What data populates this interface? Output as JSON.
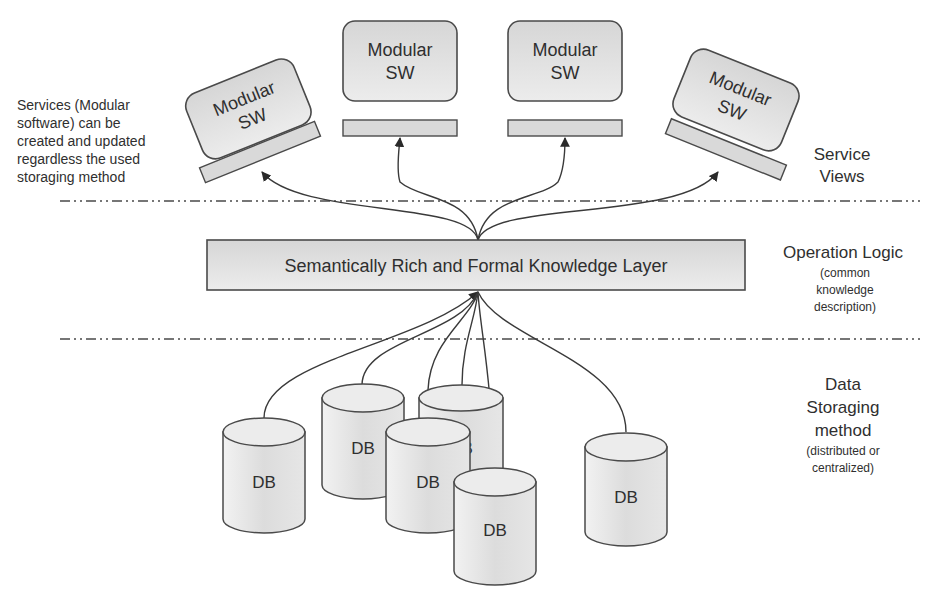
{
  "diagram": {
    "layers": {
      "service_views": {
        "label_line1": "Service",
        "label_line2": "Views"
      },
      "operation_logic": {
        "label": "Operation Logic",
        "sub_line1": "(common",
        "sub_line2": "knowledge",
        "sub_line3": "description)"
      },
      "data_storage": {
        "label_line1": "Data",
        "label_line2": "Storaging",
        "label_line3": "method",
        "sub_line1": "(distributed or",
        "sub_line2": "centralized)"
      }
    },
    "annotation": {
      "line1": "Services (Modular",
      "line2": "software) can be",
      "line3": "created and updated",
      "line4": "regardless the used",
      "line5": "storaging method"
    },
    "knowledge_layer": {
      "label": "Semantically Rich and Formal Knowledge Layer"
    },
    "modules": [
      {
        "line1": "Modular",
        "line2": "SW"
      },
      {
        "line1": "Modular",
        "line2": "SW"
      },
      {
        "line1": "Modular",
        "line2": "SW"
      },
      {
        "line1": "Modular",
        "line2": "SW"
      }
    ],
    "databases": [
      {
        "label": "DB"
      },
      {
        "label": "DB"
      },
      {
        "label": "DB"
      },
      {
        "label": "DB"
      },
      {
        "label": "DB"
      },
      {
        "label": "DB"
      }
    ],
    "colors": {
      "line": "#3a3a3a",
      "box_fill": "#e0e0e0",
      "background": "#ffffff"
    }
  }
}
